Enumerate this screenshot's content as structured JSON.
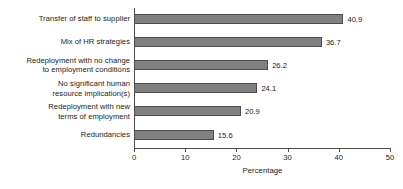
{
  "chart_data": {
    "type": "bar",
    "orientation": "horizontal",
    "title": "",
    "xlabel": "Percentage",
    "ylabel": "",
    "xlim": [
      0,
      50
    ],
    "xticks": [
      0,
      10,
      20,
      30,
      40,
      50
    ],
    "xtick_labels": [
      "0",
      "10",
      "20",
      "30",
      "40",
      "50"
    ],
    "grid": false,
    "legend": false,
    "bar_color": "#808080",
    "bar_edge_color": "#4d4d4d",
    "categories": [
      "Transfer of staff to supplier",
      "Mix of HR strategies",
      "Redeployment with no change to employment conditions",
      "No significant human resource implication(s)",
      "Redeployment with new terms of employment",
      "Redundancies"
    ],
    "category_lines": [
      [
        "Transfer of staff to supplier"
      ],
      [
        "Mix of HR strategies"
      ],
      [
        "Redeployment with no change",
        "to employment conditions"
      ],
      [
        "No significant human",
        "resource implication(s)"
      ],
      [
        "Redeployment with new",
        "terms of employment"
      ],
      [
        "Redundancies"
      ]
    ],
    "values": [
      40.9,
      36.7,
      26.2,
      24.1,
      20.9,
      15.6
    ],
    "value_labels": [
      "40.9",
      "36.7",
      "26.2",
      "24.1",
      "20.9",
      "15.6"
    ]
  }
}
